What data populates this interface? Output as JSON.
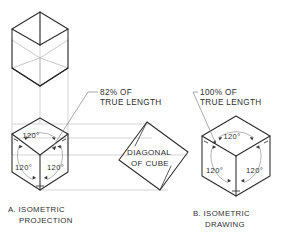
{
  "drawing": {
    "title_a": "A. ISOMETRIC",
    "title_a_line2": "PROJECTION",
    "title_b": "B. ISOMETRIC",
    "title_b_line2": "DRAWING",
    "note_left_line1": "82% OF",
    "note_left_line2": "TRUE LENGTH",
    "note_right_line1": "100% OF",
    "note_right_line2": "TRUE LENGTH",
    "diagonal_label_line1": "DIAGONAL",
    "diagonal_label_line2": "OF CUBE",
    "angle_top_left": "120°",
    "angle_lower_left_left": "120°",
    "angle_lower_right_left": "120°",
    "angle_top_right": "120°",
    "angle_lower_left_right": "120°",
    "angle_lower_right_right": "120°",
    "colors": {
      "object_line": "#2b2b2b",
      "hidden_line": "#b9b9b9",
      "projection_line": "#c2c2c2",
      "leader_line": "#8d8d8d",
      "text": "#2f2f2f",
      "background": "#ffffff"
    }
  }
}
